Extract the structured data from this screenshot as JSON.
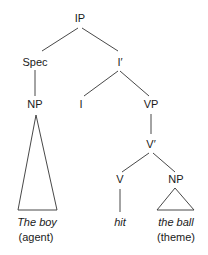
{
  "diagram": {
    "type": "syntax-tree",
    "nodes": [
      {
        "id": "IP",
        "label": "IP"
      },
      {
        "id": "Spec",
        "label": "Spec"
      },
      {
        "id": "Ibar",
        "label": "I′"
      },
      {
        "id": "NP1",
        "label": "NP"
      },
      {
        "id": "I",
        "label": "I"
      },
      {
        "id": "VP",
        "label": "VP"
      },
      {
        "id": "Vbar",
        "label": "V′"
      },
      {
        "id": "V",
        "label": "V"
      },
      {
        "id": "NP2",
        "label": "NP"
      }
    ],
    "edges": [
      [
        "IP",
        "Spec"
      ],
      [
        "IP",
        "Ibar"
      ],
      [
        "Spec",
        "NP1"
      ],
      [
        "Ibar",
        "I"
      ],
      [
        "Ibar",
        "VP"
      ],
      [
        "VP",
        "Vbar"
      ],
      [
        "Vbar",
        "V"
      ],
      [
        "Vbar",
        "NP2"
      ],
      [
        "V",
        "hit"
      ]
    ],
    "leaves": [
      {
        "id": "boy",
        "parent": "NP1",
        "text": "The boy",
        "role": "(agent)",
        "triangle": true
      },
      {
        "id": "hit",
        "parent": "V",
        "text": "hit",
        "role": "",
        "triangle": false
      },
      {
        "id": "ball",
        "parent": "NP2",
        "text": "the ball",
        "role": "(theme)",
        "triangle": true
      }
    ]
  }
}
